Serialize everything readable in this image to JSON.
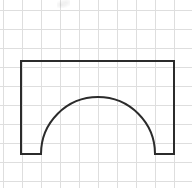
{
  "figure": {
    "canvas": {
      "width": 192,
      "height": 188,
      "background": "#ffffff"
    },
    "grid": {
      "visible": true,
      "color": "#dedede",
      "line_width": 1,
      "cell_size": 19,
      "origin_x": 3,
      "origin_y": 10,
      "columns": 10,
      "rows": 10,
      "x_positions": [
        3,
        22,
        41,
        60,
        79,
        98,
        117,
        136,
        155,
        174
      ],
      "y_positions": [
        10,
        29,
        48,
        67,
        86,
        105,
        124,
        143,
        162,
        181
      ]
    },
    "shape": {
      "name": "arch-outline",
      "type": "rectangle-with-semicircular-cutout",
      "stroke_color": "#2b2b2b",
      "stroke_width": 2,
      "fill": "none",
      "rectangle": {
        "left": 21,
        "top": 61,
        "right": 174,
        "bottom": 154,
        "width": 153,
        "height": 93
      },
      "arch": {
        "center_x": 98,
        "center_y": 154,
        "radius": 57,
        "left_foot_x": 41,
        "right_foot_x": 155,
        "apex_x": 98,
        "apex_y": 96,
        "sweep": "semicircle",
        "opens": "downward"
      },
      "leg_left": {
        "x": 21,
        "width": 20,
        "from_x": 21,
        "to_x": 41
      },
      "leg_right": {
        "x": 174,
        "width": 19,
        "from_x": 155,
        "to_x": 174
      },
      "path_d": "M21,61 L174,61 L174,154 L155,154 A57,57 0 0 0 41,154 L21,154 Z"
    },
    "artifact": {
      "name": "top-smudge",
      "visible": true,
      "x": 57,
      "y": 0,
      "width": 13,
      "height": 8
    }
  }
}
